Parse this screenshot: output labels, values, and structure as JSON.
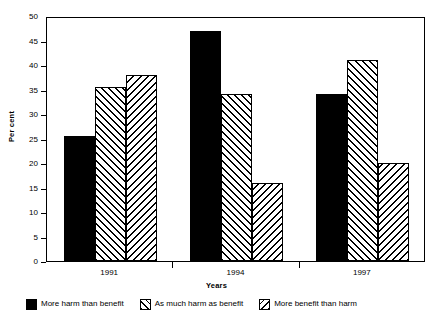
{
  "chart_data": {
    "type": "bar",
    "title": "",
    "xlabel": "Years",
    "ylabel": "Per cent",
    "categories": [
      "1991",
      "1994",
      "1997"
    ],
    "series": [
      {
        "name": "More harm than benefit",
        "values": [
          25.5,
          47.0,
          34.0
        ],
        "fill": "solid",
        "color": "#000000"
      },
      {
        "name": "As much harm as benefit",
        "values": [
          35.5,
          34.0,
          41.0
        ],
        "fill": "hatch-fwd",
        "color": "#000000"
      },
      {
        "name": "More benefit than harm",
        "values": [
          38.0,
          16.0,
          20.0
        ],
        "fill": "hatch-back",
        "color": "#000000"
      }
    ],
    "ylim": [
      0,
      50
    ],
    "yticks": [
      0,
      5,
      10,
      15,
      20,
      25,
      30,
      35,
      40,
      45,
      50
    ],
    "ytick_labels": [
      "0",
      "5",
      "10",
      "15",
      "20",
      "25",
      "30",
      "35",
      "40",
      "45",
      "50"
    ],
    "grid": false,
    "legend_position": "bottom",
    "frame": "box"
  },
  "axes": {
    "y_title": "Per cent",
    "x_title": "Years"
  },
  "legend": {
    "items": [
      {
        "label": "More harm than benefit",
        "swatch": "solid-swatch"
      },
      {
        "label": "As much harm as benefit",
        "swatch": "forward-hatch-swatch"
      },
      {
        "label": "More benefit than harm",
        "swatch": "backward-hatch-swatch"
      }
    ]
  }
}
